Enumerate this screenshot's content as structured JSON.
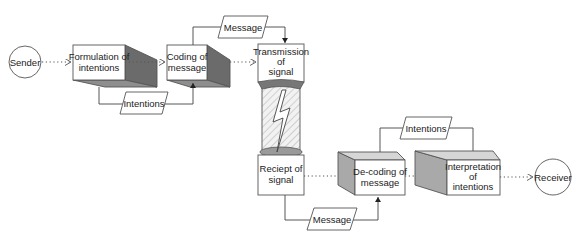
{
  "diagram": {
    "type": "communication-process-flow",
    "nodes": {
      "sender": {
        "label": "Sender"
      },
      "formulation": {
        "line1": "Formulation of",
        "line2": "intentions"
      },
      "coding": {
        "line1": "Coding of",
        "line2": "message"
      },
      "transmission": {
        "line1": "Transmission",
        "line2": "of",
        "line3": "signal"
      },
      "receipt": {
        "line1": "Reciept of",
        "line2": "signal"
      },
      "decoding": {
        "line1": "De-coding of",
        "line2": "message"
      },
      "interpretation": {
        "line1": "Interpretation",
        "line2": "of",
        "line3": "intentions"
      },
      "receiver": {
        "label": "Receiver"
      }
    },
    "data_items": {
      "message_top": "Message",
      "intentions_left": "Intentions",
      "intentions_right": "Intentions",
      "message_bottom": "Message"
    },
    "channel": {
      "icon": "lightning-bolt-icon"
    },
    "flow": [
      "Sender",
      "Formulation of intentions",
      "Coding of message",
      "Transmission of signal",
      "Reciept of signal",
      "De-coding of message",
      "Interpretation of intentions",
      "Receiver"
    ],
    "colors": {
      "dark_face": "#6b6b6b",
      "light_face": "#a9a9a9",
      "stroke": "#555555"
    }
  }
}
